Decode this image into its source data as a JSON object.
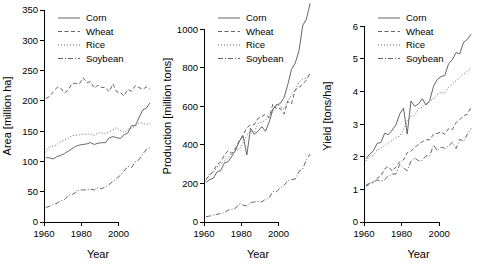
{
  "figure": {
    "background": "#ffffff",
    "series_color": "#555555",
    "panel_count": 3
  },
  "legend": {
    "entries": [
      {
        "label": "Corn",
        "dash": "solid"
      },
      {
        "label": "Wheat",
        "dash": "dashed"
      },
      {
        "label": "Rice",
        "dash": "dotted"
      },
      {
        "label": "Soybean",
        "dash": "dashdot"
      }
    ]
  },
  "chart_data": [
    {
      "type": "line",
      "title": "",
      "xlabel": "Year",
      "ylabel": "Area [million ha]",
      "xlim": [
        1960,
        2018
      ],
      "ylim": [
        0,
        350
      ],
      "xticks": [
        1960,
        1980,
        2000
      ],
      "yticks": [
        0,
        50,
        100,
        150,
        200,
        250,
        300,
        350
      ],
      "grid": false,
      "legend_position": "top-left",
      "x": [
        1961,
        1963,
        1965,
        1967,
        1969,
        1971,
        1973,
        1975,
        1977,
        1979,
        1981,
        1983,
        1985,
        1987,
        1989,
        1991,
        1993,
        1995,
        1997,
        1999,
        2001,
        2003,
        2005,
        2007,
        2009,
        2011,
        2013,
        2015,
        2017
      ],
      "series": [
        {
          "name": "Corn",
          "dash": "solid",
          "values": [
            106,
            106,
            104,
            108,
            110,
            113,
            117,
            121,
            125,
            127,
            128,
            129,
            131,
            128,
            130,
            131,
            131,
            139,
            141,
            139,
            138,
            144,
            147,
            159,
            159,
            172,
            185,
            188,
            197
          ]
        },
        {
          "name": "Wheat",
          "dash": "dashed",
          "values": [
            204,
            207,
            215,
            222,
            221,
            213,
            218,
            228,
            229,
            228,
            238,
            230,
            232,
            221,
            226,
            222,
            222,
            215,
            228,
            215,
            214,
            208,
            219,
            216,
            225,
            222,
            219,
            223,
            219
          ]
        },
        {
          "name": "Rice",
          "dash": "dotted",
          "values": [
            115,
            124,
            125,
            128,
            133,
            135,
            138,
            143,
            143,
            144,
            145,
            145,
            145,
            143,
            147,
            147,
            146,
            149,
            152,
            156,
            151,
            148,
            153,
            155,
            158,
            163,
            163,
            161,
            163
          ]
        },
        {
          "name": "Soybean",
          "dash": "dashdot",
          "values": [
            24,
            26,
            29,
            31,
            35,
            37,
            44,
            45,
            49,
            53,
            53,
            53,
            54,
            53,
            57,
            55,
            58,
            62,
            67,
            72,
            77,
            84,
            92,
            90,
            99,
            103,
            112,
            120,
            123
          ]
        }
      ]
    },
    {
      "type": "line",
      "title": "",
      "xlabel": "Year",
      "ylabel": "Production [million tons]",
      "xlim": [
        1960,
        2018
      ],
      "ylim": [
        0,
        1100
      ],
      "xticks": [
        1960,
        1980,
        2000
      ],
      "yticks": [
        0,
        200,
        400,
        600,
        800,
        1000
      ],
      "grid": false,
      "legend_position": "top-left",
      "x": [
        1961,
        1963,
        1965,
        1967,
        1969,
        1971,
        1973,
        1975,
        1977,
        1979,
        1981,
        1983,
        1985,
        1987,
        1989,
        1991,
        1993,
        1995,
        1997,
        1999,
        2001,
        2003,
        2005,
        2007,
        2009,
        2011,
        2013,
        2015,
        2017
      ],
      "series": [
        {
          "name": "Corn",
          "dash": "solid",
          "values": [
            205,
            220,
            227,
            260,
            268,
            307,
            313,
            342,
            372,
            420,
            447,
            348,
            486,
            455,
            471,
            495,
            471,
            518,
            586,
            607,
            615,
            646,
            713,
            792,
            825,
            888,
            1019,
            1053,
            1135
          ]
        },
        {
          "name": "Wheat",
          "dash": "dashed",
          "values": [
            222,
            240,
            265,
            298,
            312,
            348,
            370,
            356,
            386,
            421,
            452,
            489,
            504,
            505,
            538,
            546,
            560,
            542,
            613,
            586,
            590,
            560,
            626,
            612,
            686,
            698,
            715,
            737,
            772
          ]
        },
        {
          "name": "Rice",
          "dash": "dotted",
          "values": [
            216,
            250,
            256,
            284,
            300,
            317,
            336,
            357,
            372,
            378,
            411,
            450,
            469,
            466,
            511,
            518,
            528,
            548,
            577,
            611,
            600,
            585,
            632,
            657,
            685,
            726,
            741,
            745,
            770
          ]
        },
        {
          "name": "Soybean",
          "dash": "dashdot",
          "values": [
            27,
            31,
            35,
            40,
            44,
            48,
            62,
            66,
            72,
            94,
            88,
            83,
            101,
            104,
            107,
            104,
            118,
            126,
            158,
            158,
            177,
            190,
            214,
            220,
            223,
            262,
            276,
            323,
            353
          ]
        }
      ]
    },
    {
      "type": "line",
      "title": "",
      "xlabel": "Year",
      "ylabel": "Yield [tons/ha]",
      "xlim": [
        1960,
        2018
      ],
      "ylim": [
        0,
        6.5
      ],
      "xticks": [
        1960,
        1980,
        2000
      ],
      "yticks": [
        0,
        1,
        2,
        3,
        4,
        5,
        6
      ],
      "grid": false,
      "legend_position": "top-left",
      "x": [
        1961,
        1963,
        1965,
        1967,
        1969,
        1971,
        1973,
        1975,
        1977,
        1979,
        1981,
        1983,
        1985,
        1987,
        1989,
        1991,
        1993,
        1995,
        1997,
        1999,
        2001,
        2003,
        2005,
        2007,
        2009,
        2011,
        2013,
        2015,
        2017
      ],
      "series": [
        {
          "name": "Corn",
          "dash": "solid",
          "values": [
            1.94,
            2.08,
            2.18,
            2.41,
            2.44,
            2.72,
            2.68,
            2.82,
            2.98,
            3.31,
            3.49,
            2.7,
            3.71,
            3.55,
            3.62,
            3.78,
            3.59,
            3.73,
            4.16,
            4.37,
            4.46,
            4.49,
            4.85,
            4.98,
            5.19,
            5.16,
            5.51,
            5.6,
            5.76
          ]
        },
        {
          "name": "Wheat",
          "dash": "dashed",
          "values": [
            1.09,
            1.16,
            1.23,
            1.34,
            1.41,
            1.63,
            1.7,
            1.56,
            1.69,
            1.85,
            1.9,
            2.13,
            2.17,
            2.29,
            2.38,
            2.46,
            2.52,
            2.52,
            2.69,
            2.72,
            2.76,
            2.69,
            2.86,
            2.83,
            3.05,
            3.14,
            3.26,
            3.3,
            3.53
          ]
        },
        {
          "name": "Rice",
          "dash": "dotted",
          "values": [
            1.87,
            2.02,
            2.05,
            2.22,
            2.26,
            2.35,
            2.44,
            2.5,
            2.6,
            2.63,
            2.83,
            3.1,
            3.24,
            3.26,
            3.48,
            3.52,
            3.62,
            3.67,
            3.8,
            3.91,
            3.97,
            3.95,
            4.13,
            4.23,
            4.33,
            4.45,
            4.54,
            4.62,
            4.72
          ]
        },
        {
          "name": "Soybean",
          "dash": "dashdot",
          "values": [
            1.13,
            1.19,
            1.21,
            1.29,
            1.26,
            1.3,
            1.41,
            1.47,
            1.47,
            1.77,
            1.66,
            1.57,
            1.87,
            1.96,
            1.88,
            1.89,
            2.03,
            2.03,
            2.36,
            2.19,
            2.3,
            2.26,
            2.33,
            2.44,
            2.25,
            2.54,
            2.47,
            2.69,
            2.87
          ]
        }
      ]
    }
  ]
}
